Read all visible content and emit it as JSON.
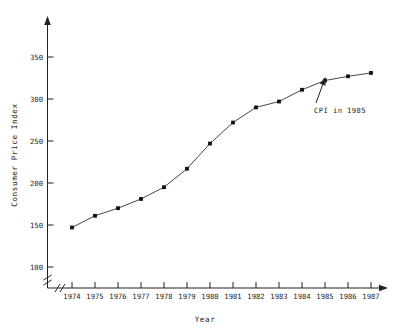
{
  "chart_data": {
    "type": "line",
    "title": "",
    "xlabel": "Year",
    "ylabel": "Consumer Price Index",
    "x": [
      1974,
      1975,
      1976,
      1977,
      1978,
      1979,
      1980,
      1981,
      1982,
      1983,
      1984,
      1985,
      1986,
      1987
    ],
    "values": [
      147,
      161,
      170,
      181,
      195,
      217,
      247,
      272,
      290,
      297,
      311,
      322,
      327,
      331
    ],
    "series": [
      {
        "name": "Consumer Price Index",
        "values": [
          147,
          161,
          170,
          181,
          195,
          217,
          247,
          272,
          290,
          297,
          311,
          322,
          327,
          331
        ]
      }
    ],
    "xtick_labels": [
      "1974",
      "1975",
      "1976",
      "1977",
      "1978",
      "1979",
      "1980",
      "1981",
      "1982",
      "1983",
      "1984",
      "1985",
      "1986",
      "1987"
    ],
    "ytick_labels": [
      "100",
      "150",
      "200",
      "250",
      "300",
      "350"
    ],
    "ytick_values": [
      100,
      150,
      200,
      250,
      300,
      350
    ],
    "ylim": [
      100,
      365
    ],
    "xlim": [
      1973.6,
      1987.9
    ],
    "grid": false,
    "legend": false,
    "axis_break_x": true,
    "axis_break_y": true,
    "marker": "filled-square",
    "annotations": [
      {
        "text": "CPI in 1985",
        "points_to_year": 1985,
        "points_to_value": 322
      }
    ]
  },
  "axes": {
    "y_title": "Consumer Price Index",
    "x_title": "Year",
    "y_ticks": [
      "100",
      "150",
      "200",
      "250",
      "300",
      "350"
    ],
    "x_ticks": [
      "1974",
      "1975",
      "1976",
      "1977",
      "1978",
      "1979",
      "1980",
      "1981",
      "1982",
      "1983",
      "1984",
      "1985",
      "1986",
      "1987"
    ]
  },
  "annotation": {
    "label": "CPI in 1985"
  },
  "colors": {
    "line": "#333333",
    "marker": "#111111",
    "axis": "#222222",
    "text": "#1a1a1a",
    "background": "#ffffff"
  }
}
